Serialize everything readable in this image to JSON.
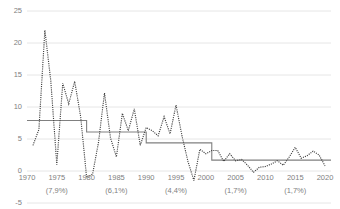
{
  "chart_data": {
    "type": "line",
    "title": "",
    "subtitle": "",
    "xlabel": "",
    "ylabel": "",
    "xlim": [
      1970,
      2021
    ],
    "ylim": [
      -5,
      25
    ],
    "yticks": [
      -5,
      0,
      5,
      10,
      15,
      20,
      25
    ],
    "xticks": [
      1970,
      1975,
      1980,
      1985,
      1990,
      1995,
      2000,
      2005,
      2010,
      2015,
      2020
    ],
    "grid": true,
    "legend": "none",
    "annotations": [
      {
        "label": "(7,9%)",
        "x": 1975
      },
      {
        "label": "(6,1%)",
        "x": 1985
      },
      {
        "label": "(4,4%)",
        "x": 1995
      },
      {
        "label": "(1,7%)",
        "x": 2005
      },
      {
        "label": "(1,7%)",
        "x": 2015
      }
    ],
    "series": [
      {
        "name": "annual-value",
        "style": "dotted",
        "color": "#404040",
        "x": [
          1971,
          1972,
          1973,
          1974,
          1975,
          1976,
          1977,
          1978,
          1979,
          1980,
          1981,
          1982,
          1983,
          1984,
          1985,
          1986,
          1987,
          1988,
          1989,
          1990,
          1991,
          1992,
          1993,
          1994,
          1995,
          1996,
          1997,
          1998,
          1999,
          2000,
          2001,
          2002,
          2003,
          2004,
          2005,
          2006,
          2007,
          2008,
          2009,
          2010,
          2011,
          2012,
          2013,
          2014,
          2015,
          2016,
          2017,
          2018,
          2019,
          2020
        ],
        "values": [
          4.0,
          6.5,
          22.0,
          14.0,
          1.0,
          13.7,
          10.5,
          14.0,
          8.5,
          -1.0,
          -0.5,
          4.5,
          12.2,
          5.2,
          2.2,
          9.0,
          6.3,
          9.7,
          4.0,
          6.8,
          6.3,
          5.5,
          8.5,
          5.8,
          10.3,
          5.5,
          1.5,
          -1.5,
          3.4,
          2.7,
          3.2,
          3.2,
          1.5,
          2.7,
          1.6,
          1.8,
          0.9,
          -0.2,
          0.6,
          0.7,
          1.1,
          1.6,
          0.9,
          2.2,
          3.7,
          2.0,
          2.4,
          3.1,
          2.5,
          0.8
        ]
      },
      {
        "name": "period-average-step",
        "style": "solid",
        "color": "#808080",
        "steps": [
          {
            "x0": 1970,
            "x1": 1980,
            "y": 7.9
          },
          {
            "x0": 1980,
            "x1": 1990,
            "y": 6.1
          },
          {
            "x0": 1990,
            "x1": 2000,
            "y": 4.4
          },
          {
            "x0": 2000,
            "x1": 2001,
            "y": 4.4
          },
          {
            "x0": 2001,
            "x1": 2021,
            "y": 1.7
          }
        ]
      }
    ]
  },
  "axis": {
    "y_labels": [
      "25",
      "20",
      "15",
      "10",
      "5",
      "0",
      "-5"
    ],
    "x_labels": [
      "1970",
      "1975",
      "1980",
      "1985",
      "1990",
      "1995",
      "2000",
      "2005",
      "2010",
      "2015",
      "2020"
    ],
    "x_annotations": [
      "(7,9%)",
      "(6,1%)",
      "(4,4%)",
      "(1,7%)",
      "(1,7%)"
    ]
  },
  "colors": {
    "grid": "#e6e6e6",
    "series_dotted": "#404040",
    "series_step": "#808080",
    "tick_text": "#808080",
    "background": "#ffffff"
  }
}
